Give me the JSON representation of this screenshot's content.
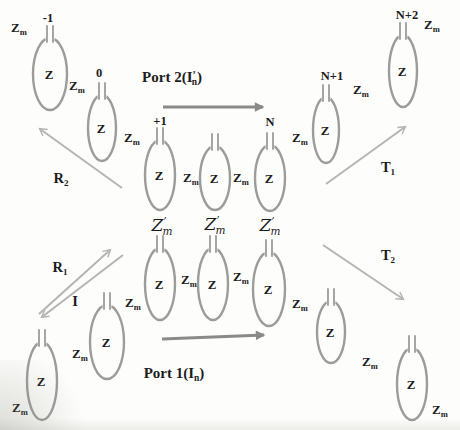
{
  "symbols": {
    "self_impedance": "Z",
    "mutual_impedance": {
      "base": "Z",
      "sub": "m"
    },
    "coupling_impedance": {
      "base": "Z",
      "prime": "’",
      "sub": "m"
    }
  },
  "indices": {
    "minus_one": "-1",
    "zero": "0",
    "plus_one": "+1",
    "N": "N",
    "N_plus_1": "N+1",
    "N_plus_2": "N+2"
  },
  "ports": {
    "port1": {
      "prefix": "Port 1(",
      "base": "I",
      "sub": "n",
      "suffix": ")"
    },
    "port2": {
      "prefix": "Port 2(",
      "base": "I",
      "prime": "’",
      "sub": "n",
      "suffix": ")"
    }
  },
  "waves": {
    "incident": "I",
    "R1": {
      "base": "R",
      "sub": "1"
    },
    "R2": {
      "base": "R",
      "sub": "2"
    },
    "T1": {
      "base": "T",
      "sub": "1"
    },
    "T2": {
      "base": "T",
      "sub": "2"
    }
  },
  "colors": {
    "background": "#fdfdfb",
    "resonator_stroke": "#9c9c9c",
    "port_arrow": "#8a8a8a",
    "wave_arrow": "#b5b5b5",
    "text": "#1c1c1c"
  }
}
